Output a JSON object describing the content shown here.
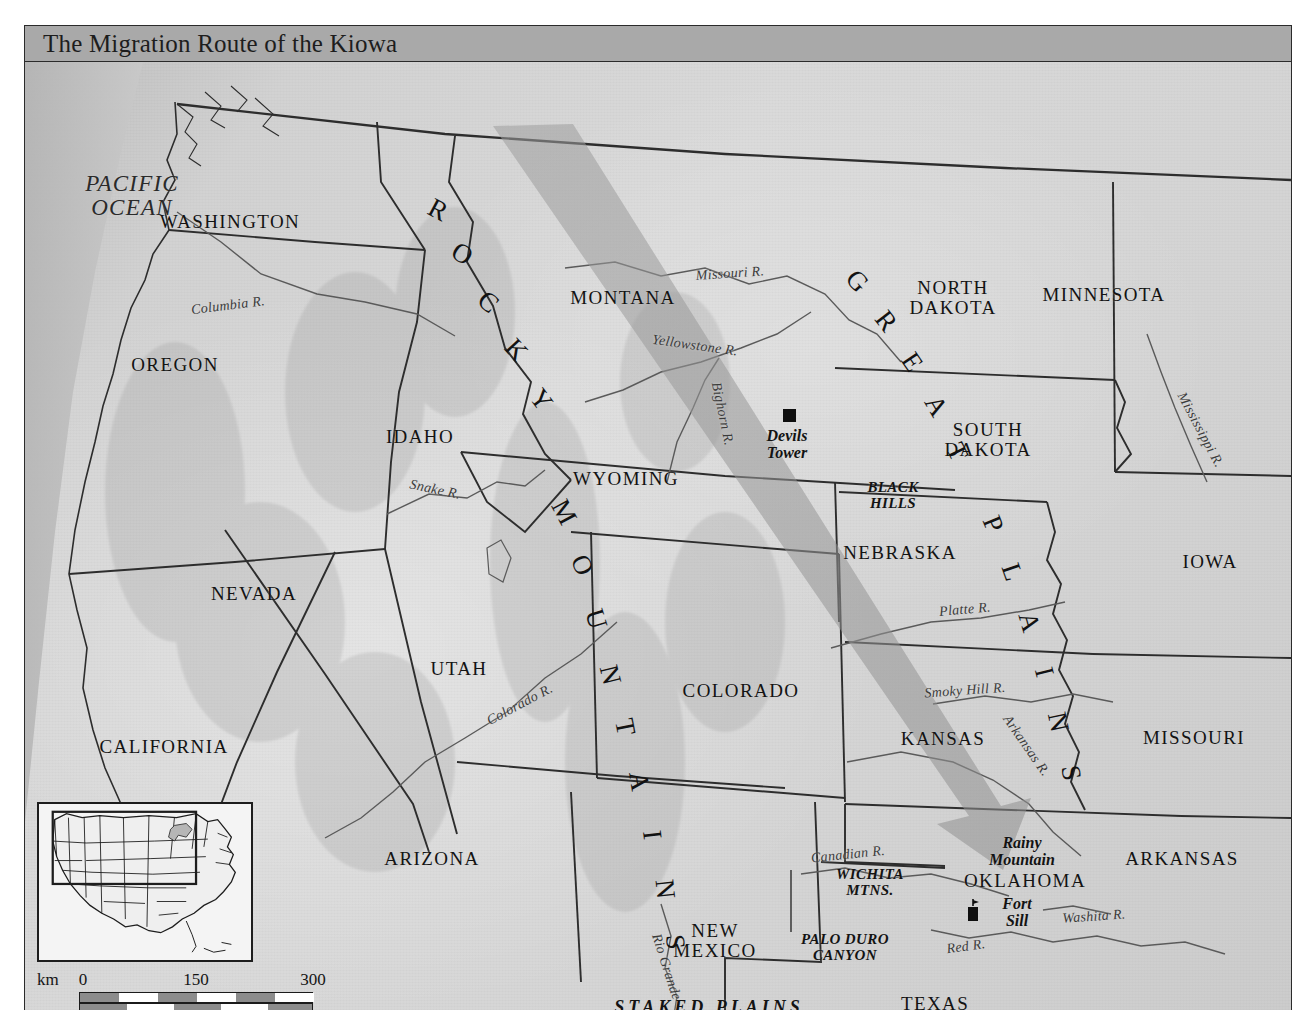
{
  "runhead": {
    "text": ""
  },
  "banner": {
    "title": "The Migration Route of the Kiowa"
  },
  "ocean": {
    "line1": "PACIFIC",
    "line2": "OCEAN"
  },
  "states": [
    {
      "name": "WASHINGTON",
      "x": 205,
      "y": 150
    },
    {
      "name": "OREGON",
      "x": 150,
      "y": 293
    },
    {
      "name": "IDAHO",
      "x": 395,
      "y": 365
    },
    {
      "name": "MONTANA",
      "x": 598,
      "y": 226
    },
    {
      "name": "WYOMING",
      "x": 601,
      "y": 407
    },
    {
      "name": "NEVADA",
      "x": 229,
      "y": 522
    },
    {
      "name": "UTAH",
      "x": 434,
      "y": 597
    },
    {
      "name": "CALIFORNIA",
      "x": 139,
      "y": 675
    },
    {
      "name": "ARIZONA",
      "x": 407,
      "y": 787
    },
    {
      "name": "COLORADO",
      "x": 716,
      "y": 619
    },
    {
      "name": "KANSAS",
      "x": 918,
      "y": 667
    },
    {
      "name": "NEBRASKA",
      "x": 875,
      "y": 481
    },
    {
      "name": "IOWA",
      "x": 1185,
      "y": 490
    },
    {
      "name": "MINNESOTA",
      "x": 1079,
      "y": 223
    },
    {
      "name": "MISSOURI",
      "x": 1169,
      "y": 666
    },
    {
      "name": "ARKANSAS",
      "x": 1157,
      "y": 787
    },
    {
      "name": "OKLAHOMA",
      "x": 1000,
      "y": 809
    },
    {
      "name": "TEXAS",
      "x": 910,
      "y": 932
    }
  ],
  "states_two_line": [
    {
      "line1": "NORTH",
      "line2": "DAKOTA",
      "x": 928,
      "y": 230
    },
    {
      "line1": "SOUTH",
      "line2": "DAKOTA",
      "x": 963,
      "y": 372
    },
    {
      "line1": "NEW",
      "line2": "MEXICO",
      "x": 690,
      "y": 873
    }
  ],
  "rivers": [
    {
      "name": "Columbia R.",
      "x": 203,
      "y": 244,
      "rot": -7
    },
    {
      "name": "Snake R.",
      "x": 410,
      "y": 428,
      "rot": 12
    },
    {
      "name": "Missouri R.",
      "x": 705,
      "y": 212,
      "rot": -4
    },
    {
      "name": "Yellowstone R.",
      "x": 670,
      "y": 284,
      "rot": 8
    },
    {
      "name": "Bighorn R.",
      "x": 697,
      "y": 352,
      "rot": 78
    },
    {
      "name": "Mississippi R.",
      "x": 1175,
      "y": 368,
      "rot": 62
    },
    {
      "name": "Platte R.",
      "x": 940,
      "y": 548,
      "rot": -5
    },
    {
      "name": "Smoky Hill R.",
      "x": 940,
      "y": 629,
      "rot": -4
    },
    {
      "name": "Arkansas R.",
      "x": 1001,
      "y": 684,
      "rot": 55
    },
    {
      "name": "Colorado R.",
      "x": 495,
      "y": 643,
      "rot": -28
    },
    {
      "name": "Rio Grande",
      "x": 641,
      "y": 905,
      "rot": 72
    },
    {
      "name": "Canadian R.",
      "x": 823,
      "y": 793,
      "rot": -6
    },
    {
      "name": "Red R.",
      "x": 941,
      "y": 885,
      "rot": -8
    },
    {
      "name": "Washita R.",
      "x": 1069,
      "y": 855,
      "rot": -4
    }
  ],
  "features": [
    {
      "name": "BLACK HILLS",
      "lines": [
        "BLACK",
        "HILLS"
      ],
      "x": 868,
      "y": 427
    },
    {
      "name": "WICHITA MTNS.",
      "lines": [
        "WICHITA",
        "MTNS."
      ],
      "x": 845,
      "y": 814
    },
    {
      "name": "PALO DURO CANYON",
      "lines": [
        "PALO DURO",
        "CANYON"
      ],
      "x": 820,
      "y": 880
    }
  ],
  "sites": [
    {
      "name": "Devils Tower",
      "lines": [
        "Devils",
        "Tower"
      ],
      "x": 762,
      "y": 396,
      "marker": "square-marker"
    },
    {
      "name": "Rainy Mountain",
      "lines": [
        "Rainy",
        "Mountain"
      ],
      "x": 997,
      "y": 783,
      "marker": "none"
    },
    {
      "name": "Fort Sill",
      "lines": [
        "Fort",
        "Sill"
      ],
      "x": 966,
      "y": 847,
      "marker": "fort-marker"
    }
  ],
  "regions": [
    {
      "name": "STAKED PLAINS",
      "x": 684,
      "y": 943
    }
  ],
  "curved_labels": [
    {
      "name": "ROCKY MOUNTAINS",
      "text": "ROCKY MOUNTAINS",
      "chars": [
        {
          "c": "R",
          "x": 413,
          "y": 148,
          "rot": 28
        },
        {
          "c": "O",
          "x": 437,
          "y": 192,
          "rot": 33
        },
        {
          "c": "C",
          "x": 463,
          "y": 240,
          "rot": 40
        },
        {
          "c": "K",
          "x": 491,
          "y": 288,
          "rot": 47
        },
        {
          "c": "Y",
          "x": 516,
          "y": 338,
          "rot": 53
        },
        {
          "c": "M",
          "x": 539,
          "y": 450,
          "rot": 62
        },
        {
          "c": "O",
          "x": 557,
          "y": 503,
          "rot": 68
        },
        {
          "c": "U",
          "x": 571,
          "y": 557,
          "rot": 73
        },
        {
          "c": "N",
          "x": 585,
          "y": 613,
          "rot": 76
        },
        {
          "c": "T",
          "x": 600,
          "y": 665,
          "rot": 79
        },
        {
          "c": "A",
          "x": 614,
          "y": 719,
          "rot": 81
        },
        {
          "c": "I",
          "x": 627,
          "y": 773,
          "rot": 83
        },
        {
          "c": "N",
          "x": 640,
          "y": 827,
          "rot": 84
        },
        {
          "c": "S",
          "x": 650,
          "y": 880,
          "rot": 85
        }
      ]
    },
    {
      "name": "GREAT PLAINS",
      "text": "GREAT PLAINS",
      "chars": [
        {
          "c": "G",
          "x": 832,
          "y": 219,
          "rot": 48
        },
        {
          "c": "R",
          "x": 861,
          "y": 259,
          "rot": 52
        },
        {
          "c": "E",
          "x": 887,
          "y": 300,
          "rot": 56
        },
        {
          "c": "A",
          "x": 911,
          "y": 344,
          "rot": 60
        },
        {
          "c": "T",
          "x": 932,
          "y": 390,
          "rot": 64
        },
        {
          "c": "P",
          "x": 968,
          "y": 462,
          "rot": 68
        },
        {
          "c": "L",
          "x": 987,
          "y": 510,
          "rot": 71
        },
        {
          "c": "A",
          "x": 1004,
          "y": 560,
          "rot": 74
        },
        {
          "c": "I",
          "x": 1019,
          "y": 610,
          "rot": 76
        },
        {
          "c": "N",
          "x": 1033,
          "y": 660,
          "rot": 78
        },
        {
          "c": "S",
          "x": 1046,
          "y": 711,
          "rot": 80
        }
      ]
    }
  ],
  "migration_arrow": {
    "name": "kiowa-migration-route-arrow",
    "description": "Broad translucent gray band running from northwest (Montana / Yellowstone country) southeast to southwestern Oklahoma",
    "color": "#9a9a9a",
    "opacity": 0.55
  },
  "inset": {
    "name": "locator-inset-map",
    "caption": "",
    "highlight_label": ""
  },
  "scale": {
    "km_unit": "km",
    "mi_unit": "mi",
    "km_ticks": [
      "0",
      "150",
      "300"
    ],
    "mi_ticks": [
      "0",
      "150",
      "300"
    ]
  },
  "colors": {
    "banner_fill": "#a9a9a9",
    "frame_stroke": "#2b2b2b",
    "land_fill": "#d4d4d4",
    "ocean_fill": "#c3c3c3",
    "state_border": "#2d2d2d",
    "river_stroke": "#5a5a5a",
    "arrow_fill": "#9a9a9a",
    "label_text": "#131313"
  }
}
